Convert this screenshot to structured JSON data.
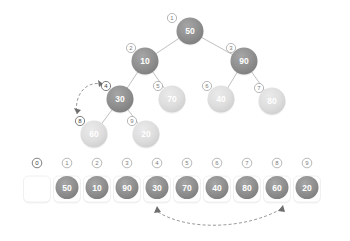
{
  "colors": {
    "node_dark": "#8f8f8f",
    "node_light": "#dcdcdc",
    "node_text": "#ffffff",
    "edge": "#b9b9b9",
    "index_ring": "#9a9a9a",
    "index_text": "#7d7d7d",
    "arrow": "#6e6e6e",
    "cell_fill": "#ffffff",
    "cell_border": "#ececec",
    "background": "#ffffff"
  },
  "tree": {
    "label": "heap-tree",
    "nodes": [
      {
        "index": "1",
        "value": "50",
        "cx": 190,
        "cy": 31,
        "r": 13.5,
        "shade": "dark",
        "idx_cx": 172,
        "idx_cy": 18,
        "idx_dark": false
      },
      {
        "index": "2",
        "value": "10",
        "cx": 145,
        "cy": 61,
        "r": 13.5,
        "shade": "dark",
        "idx_cx": 131,
        "idx_cy": 48,
        "idx_dark": false
      },
      {
        "index": "3",
        "value": "90",
        "cx": 244,
        "cy": 61,
        "r": 13.5,
        "shade": "dark",
        "idx_cx": 231,
        "idx_cy": 48,
        "idx_dark": false
      },
      {
        "index": "4",
        "value": "30",
        "cx": 120,
        "cy": 99,
        "r": 13.5,
        "shade": "dark",
        "idx_cx": 106,
        "idx_cy": 86,
        "idx_dark": true
      },
      {
        "index": "5",
        "value": "70",
        "cx": 172,
        "cy": 99,
        "r": 13.5,
        "shade": "light",
        "idx_cx": 158,
        "idx_cy": 86,
        "idx_dark": false
      },
      {
        "index": "6",
        "value": "40",
        "cx": 221,
        "cy": 99,
        "r": 13.5,
        "shade": "light",
        "idx_cx": 207,
        "idx_cy": 86,
        "idx_dark": false
      },
      {
        "index": "7",
        "value": "80",
        "cx": 272,
        "cy": 101,
        "r": 13.5,
        "shade": "light",
        "idx_cx": 259,
        "idx_cy": 88,
        "idx_dark": false
      },
      {
        "index": "8",
        "value": "60",
        "cx": 94,
        "cy": 134,
        "r": 13.5,
        "shade": "light",
        "idx_cx": 80,
        "idx_cy": 121,
        "idx_dark": true
      },
      {
        "index": "9",
        "value": "20",
        "cx": 146,
        "cy": 134,
        "r": 13.5,
        "shade": "light",
        "idx_cx": 132,
        "idx_cy": 121,
        "idx_dark": false
      }
    ],
    "edges": [
      {
        "from": "1",
        "to": "2"
      },
      {
        "from": "1",
        "to": "3"
      },
      {
        "from": "2",
        "to": "4"
      },
      {
        "from": "2",
        "to": "5"
      },
      {
        "from": "3",
        "to": "6"
      },
      {
        "from": "3",
        "to": "7"
      },
      {
        "from": "4",
        "to": "8"
      },
      {
        "from": "4",
        "to": "9"
      }
    ],
    "swap_arrow": {
      "label": "tree-swap-indicator",
      "from_index": "4",
      "to_index": "8",
      "path": "M 103 84 C 82 80, 74 100, 77 114"
    }
  },
  "array": {
    "label": "heap-array",
    "indices": [
      "0",
      "1",
      "2",
      "3",
      "4",
      "5",
      "6",
      "7",
      "8",
      "9"
    ],
    "values": [
      "",
      "50",
      "10",
      "90",
      "30",
      "70",
      "40",
      "80",
      "60",
      "20"
    ],
    "empty_cell_index": "0",
    "cell_width": 30,
    "cell_height": 26,
    "start_x": 22,
    "cell_y": 176,
    "index_y": 163,
    "swap_arrow": {
      "label": "array-swap-indicator",
      "from_index": "4",
      "to_index": "8",
      "path": "M 158 212 C 190 232, 248 228, 281 209"
    }
  }
}
